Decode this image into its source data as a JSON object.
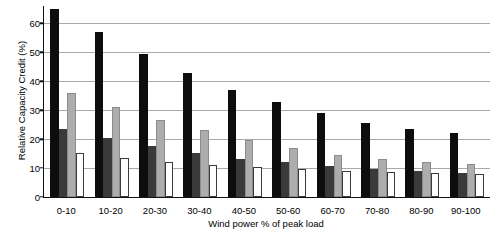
{
  "chart_data": {
    "type": "bar",
    "title": "",
    "xlabel": "Wind power % of peak load",
    "ylabel": "Relative Capacity Credit (%)",
    "categories": [
      "0-10",
      "10-20",
      "20-30",
      "30-40",
      "40-50",
      "50-60",
      "60-70",
      "70-80",
      "80-90",
      "90-100"
    ],
    "category_suffix": "%",
    "ylim": [
      0,
      66
    ],
    "yticks": [
      0,
      10,
      20,
      30,
      40,
      50,
      60
    ],
    "ytick_labels": [
      "0",
      "10",
      "20",
      "30",
      "40",
      "50",
      "60"
    ],
    "grid": "horizontal",
    "legend": "none",
    "series": [
      {
        "name": "series-1-black",
        "color": "#0d0d0d",
        "values": [
          65.0,
          57.0,
          49.5,
          43.0,
          37.0,
          33.0,
          29.0,
          25.5,
          23.5,
          22.0
        ]
      },
      {
        "name": "series-2-dark-grey",
        "color": "#3a3a3a",
        "values": [
          23.5,
          20.3,
          17.5,
          15.2,
          13.2,
          12.0,
          10.8,
          9.6,
          8.9,
          8.2
        ]
      },
      {
        "name": "series-3-light-grey",
        "color": "#adadad",
        "values": [
          36.0,
          31.0,
          26.6,
          23.0,
          19.8,
          17.0,
          14.6,
          13.0,
          12.2,
          11.5
        ]
      },
      {
        "name": "series-4-white",
        "color": "#ffffff",
        "values": [
          15.3,
          13.6,
          12.2,
          11.1,
          10.5,
          9.8,
          9.0,
          8.7,
          8.2,
          7.9
        ]
      }
    ]
  }
}
